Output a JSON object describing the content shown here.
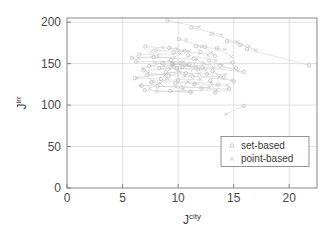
{
  "chart_data": {
    "type": "scatter",
    "title": "",
    "xlabel": "J",
    "xlabel_sup": "city",
    "ylabel": "J",
    "ylabel_sup": "irr",
    "xlim": [
      0,
      22.5
    ],
    "ylim": [
      0,
      205
    ],
    "xticks": [
      0,
      5,
      10,
      15,
      20
    ],
    "yticks": [
      0,
      50,
      100,
      150,
      200
    ],
    "xticklabels": [
      "0",
      "5",
      "10",
      "15",
      "20"
    ],
    "yticklabels": [
      "0",
      "50",
      "100",
      "150",
      "200"
    ],
    "grid": true,
    "grid_color": "#d2d2d2",
    "axis_color": "#7a7a7a",
    "legend": {
      "position": "lower-right",
      "entries": [
        {
          "label": "set-based",
          "marker": "circle",
          "color": "#b8b8b8"
        },
        {
          "label": "point-based",
          "marker": "cross",
          "color": "#b8b8b8"
        }
      ]
    },
    "series": [
      {
        "name": "set-based",
        "marker": "circle",
        "color": "#bcbcbc",
        "points": [
          [
            9.05,
            202.0
          ],
          [
            11.2,
            193.5
          ],
          [
            13.0,
            186.0
          ],
          [
            10.1,
            179.5
          ],
          [
            14.4,
            177.0
          ],
          [
            15.6,
            172.5
          ],
          [
            11.6,
            171.0
          ],
          [
            12.4,
            170.0
          ],
          [
            7.05,
            170.5
          ],
          [
            9.2,
            169.0
          ],
          [
            13.5,
            168.5
          ],
          [
            16.2,
            167.5
          ],
          [
            8.0,
            166.0
          ],
          [
            10.6,
            165.5
          ],
          [
            12.0,
            164.0
          ],
          [
            9.6,
            163.5
          ],
          [
            6.5,
            161.0
          ],
          [
            10.9,
            160.0
          ],
          [
            13.3,
            159.0
          ],
          [
            7.8,
            158.0
          ],
          [
            5.85,
            157.0
          ],
          [
            11.4,
            156.0
          ],
          [
            9.35,
            154.5
          ],
          [
            12.8,
            153.5
          ],
          [
            6.2,
            152.5
          ],
          [
            14.9,
            151.5
          ],
          [
            8.6,
            151.0
          ],
          [
            10.2,
            150.5
          ],
          [
            9.5,
            150.0
          ],
          [
            9.48,
            149.6
          ],
          [
            9.52,
            149.2
          ],
          [
            11.0,
            149.0
          ],
          [
            21.8,
            148.0
          ],
          [
            13.8,
            147.5
          ],
          [
            7.4,
            147.0
          ],
          [
            9.6,
            146.5
          ],
          [
            10.4,
            146.0
          ],
          [
            12.2,
            145.5
          ],
          [
            15.2,
            145.0
          ],
          [
            8.3,
            144.5
          ],
          [
            9.9,
            144.0
          ],
          [
            11.8,
            143.0
          ],
          [
            6.9,
            142.0
          ],
          [
            13.1,
            141.0
          ],
          [
            15.9,
            140.0
          ],
          [
            8.9,
            139.5
          ],
          [
            10.7,
            138.5
          ],
          [
            12.6,
            137.5
          ],
          [
            7.2,
            136.5
          ],
          [
            9.15,
            135.5
          ],
          [
            11.3,
            134.5
          ],
          [
            14.1,
            133.5
          ],
          [
            6.1,
            132.5
          ],
          [
            8.45,
            131.5
          ],
          [
            10.0,
            130.5
          ],
          [
            12.9,
            129.5
          ],
          [
            15.0,
            128.5
          ],
          [
            7.6,
            127.5
          ],
          [
            9.75,
            126.5
          ],
          [
            11.5,
            125.5
          ],
          [
            13.6,
            124.5
          ],
          [
            6.7,
            123.5
          ],
          [
            8.15,
            122.5
          ],
          [
            10.3,
            121.5
          ],
          [
            12.1,
            120.5
          ],
          [
            14.6,
            119.5
          ],
          [
            7.0,
            118.0
          ],
          [
            9.3,
            117.0
          ],
          [
            11.1,
            116.0
          ],
          [
            13.3,
            115.0
          ],
          [
            15.9,
            99.0
          ]
        ]
      },
      {
        "name": "point-based",
        "marker": "cross",
        "color": "#c4c4c4",
        "points": [
          [
            11.9,
            194.0
          ],
          [
            13.9,
            184.5
          ],
          [
            10.7,
            178.5
          ],
          [
            15.3,
            176.0
          ],
          [
            16.4,
            171.0
          ],
          [
            12.1,
            170.5
          ],
          [
            8.6,
            169.5
          ],
          [
            9.9,
            168.0
          ],
          [
            14.2,
            167.0
          ],
          [
            17.0,
            166.5
          ],
          [
            11.0,
            165.0
          ],
          [
            7.6,
            164.5
          ],
          [
            13.0,
            163.0
          ],
          [
            10.2,
            162.0
          ],
          [
            12.7,
            160.5
          ],
          [
            8.2,
            159.5
          ],
          [
            14.8,
            158.5
          ],
          [
            9.7,
            157.5
          ],
          [
            6.4,
            156.5
          ],
          [
            11.7,
            155.0
          ],
          [
            13.4,
            154.0
          ],
          [
            10.5,
            152.5
          ],
          [
            7.9,
            151.5
          ],
          [
            12.3,
            150.8
          ],
          [
            9.55,
            150.2
          ],
          [
            9.45,
            149.8
          ],
          [
            10.8,
            148.8
          ],
          [
            14.0,
            148.2
          ],
          [
            8.7,
            147.2
          ],
          [
            11.6,
            146.2
          ],
          [
            13.2,
            145.2
          ],
          [
            6.8,
            144.2
          ],
          [
            9.25,
            143.5
          ],
          [
            12.5,
            142.5
          ],
          [
            15.4,
            141.5
          ],
          [
            10.1,
            140.5
          ],
          [
            7.3,
            139.0
          ],
          [
            11.9,
            138.0
          ],
          [
            14.3,
            137.0
          ],
          [
            8.8,
            136.0
          ],
          [
            10.6,
            135.0
          ],
          [
            13.7,
            134.0
          ],
          [
            6.3,
            133.0
          ],
          [
            9.05,
            132.0
          ],
          [
            12.0,
            131.0
          ],
          [
            14.9,
            130.0
          ],
          [
            7.7,
            129.0
          ],
          [
            10.9,
            128.0
          ],
          [
            13.0,
            127.0
          ],
          [
            8.4,
            126.0
          ],
          [
            11.4,
            125.0
          ],
          [
            14.4,
            124.0
          ],
          [
            6.6,
            123.0
          ],
          [
            9.8,
            122.0
          ],
          [
            12.8,
            121.0
          ],
          [
            7.45,
            120.0
          ],
          [
            10.45,
            119.0
          ],
          [
            13.5,
            118.0
          ],
          [
            8.05,
            116.5
          ],
          [
            11.25,
            115.5
          ],
          [
            14.3,
            89.0
          ]
        ]
      }
    ],
    "connectors": [
      [
        [
          9.05,
          202.0
        ],
        [
          11.9,
          194.0
        ]
      ],
      [
        [
          11.2,
          193.5
        ],
        [
          13.9,
          184.5
        ]
      ],
      [
        [
          13.0,
          186.0
        ],
        [
          15.3,
          176.0
        ]
      ],
      [
        [
          10.1,
          179.5
        ],
        [
          12.1,
          170.5
        ]
      ],
      [
        [
          14.4,
          177.0
        ],
        [
          16.4,
          171.0
        ]
      ],
      [
        [
          7.05,
          170.5
        ],
        [
          9.9,
          168.0
        ]
      ],
      [
        [
          15.6,
          172.5
        ],
        [
          17.0,
          166.5
        ]
      ],
      [
        [
          11.6,
          171.0
        ],
        [
          14.2,
          167.0
        ]
      ],
      [
        [
          8.0,
          166.0
        ],
        [
          11.0,
          165.0
        ]
      ],
      [
        [
          9.2,
          169.0
        ],
        [
          12.7,
          160.5
        ]
      ],
      [
        [
          6.5,
          161.0
        ],
        [
          10.2,
          162.0
        ]
      ],
      [
        [
          13.5,
          168.5
        ],
        [
          14.8,
          158.5
        ]
      ],
      [
        [
          5.85,
          157.0
        ],
        [
          9.7,
          157.5
        ]
      ],
      [
        [
          7.8,
          158.0
        ],
        [
          11.7,
          155.0
        ]
      ],
      [
        [
          10.9,
          160.0
        ],
        [
          13.4,
          154.0
        ]
      ],
      [
        [
          6.2,
          152.5
        ],
        [
          10.5,
          152.5
        ]
      ],
      [
        [
          12.8,
          153.5
        ],
        [
          14.0,
          148.2
        ]
      ],
      [
        [
          8.6,
          151.0
        ],
        [
          12.3,
          150.8
        ]
      ],
      [
        [
          9.5,
          150.0
        ],
        [
          10.8,
          148.8
        ]
      ],
      [
        [
          11.4,
          156.0
        ],
        [
          13.2,
          145.2
        ]
      ],
      [
        [
          7.4,
          147.0
        ],
        [
          11.6,
          146.2
        ]
      ],
      [
        [
          6.9,
          142.0
        ],
        [
          9.25,
          143.5
        ]
      ],
      [
        [
          10.4,
          146.0
        ],
        [
          14.9,
          151.5
        ]
      ],
      [
        [
          8.3,
          144.5
        ],
        [
          12.5,
          142.5
        ]
      ],
      [
        [
          13.8,
          147.5
        ],
        [
          15.4,
          141.5
        ]
      ],
      [
        [
          9.9,
          144.0
        ],
        [
          15.2,
          145.0
        ]
      ],
      [
        [
          6.1,
          132.5
        ],
        [
          10.1,
          140.5
        ]
      ],
      [
        [
          12.2,
          145.5
        ],
        [
          15.9,
          140.0
        ]
      ],
      [
        [
          7.2,
          136.5
        ],
        [
          11.9,
          138.0
        ]
      ],
      [
        [
          8.9,
          139.5
        ],
        [
          14.3,
          137.0
        ]
      ],
      [
        [
          9.15,
          135.5
        ],
        [
          13.7,
          134.0
        ]
      ],
      [
        [
          10.0,
          130.5
        ],
        [
          12.0,
          131.0
        ]
      ],
      [
        [
          6.7,
          123.5
        ],
        [
          9.8,
          122.0
        ]
      ],
      [
        [
          8.15,
          122.5
        ],
        [
          12.8,
          121.0
        ]
      ],
      [
        [
          11.3,
          134.5
        ],
        [
          14.9,
          130.0
        ]
      ],
      [
        [
          7.6,
          127.5
        ],
        [
          10.9,
          128.0
        ]
      ],
      [
        [
          9.75,
          126.5
        ],
        [
          13.0,
          127.0
        ]
      ],
      [
        [
          11.5,
          125.5
        ],
        [
          14.4,
          124.0
        ]
      ],
      [
        [
          6.3,
          133.0
        ],
        [
          8.45,
          131.5
        ]
      ],
      [
        [
          7.0,
          118.0
        ],
        [
          11.25,
          115.5
        ]
      ],
      [
        [
          9.3,
          117.0
        ],
        [
          13.5,
          118.0
        ]
      ],
      [
        [
          10.3,
          121.5
        ],
        [
          14.6,
          119.5
        ]
      ],
      [
        [
          12.1,
          120.5
        ],
        [
          13.6,
          124.5
        ]
      ],
      [
        [
          8.05,
          116.5
        ],
        [
          11.1,
          116.0
        ]
      ],
      [
        [
          14.3,
          89.0
        ],
        [
          15.9,
          99.0
        ]
      ],
      [
        [
          13.1,
          141.0
        ],
        [
          14.1,
          133.5
        ]
      ],
      [
        [
          12.6,
          137.5
        ],
        [
          15.0,
          128.5
        ]
      ],
      [
        [
          7.9,
          151.5
        ],
        [
          9.6,
          146.5
        ]
      ],
      [
        [
          8.7,
          147.2
        ],
        [
          10.7,
          138.5
        ]
      ],
      [
        [
          9.45,
          149.8
        ],
        [
          11.0,
          149.0
        ]
      ],
      [
        [
          12.9,
          129.5
        ],
        [
          13.3,
          115.0
        ]
      ],
      [
        [
          7.3,
          139.0
        ],
        [
          8.8,
          136.0
        ]
      ],
      [
        [
          10.45,
          119.0
        ],
        [
          12.0,
          164.0
        ]
      ],
      [
        [
          9.6,
          163.5
        ],
        [
          10.6,
          165.5
        ]
      ],
      [
        [
          6.4,
          156.5
        ],
        [
          8.2,
          159.5
        ]
      ],
      [
        [
          7.45,
          120.0
        ],
        [
          9.05,
          132.0
        ]
      ],
      [
        [
          6.6,
          123.0
        ],
        [
          8.4,
          126.0
        ]
      ],
      [
        [
          6.8,
          144.2
        ],
        [
          9.35,
          154.5
        ]
      ],
      [
        [
          10.2,
          150.5
        ],
        [
          11.8,
          143.0
        ]
      ],
      [
        [
          12.4,
          170.0
        ],
        [
          13.3,
          159.0
        ]
      ],
      [
        [
          16.2,
          167.5
        ],
        [
          21.8,
          148.0
        ]
      ],
      [
        [
          7.7,
          129.0
        ],
        [
          10.0,
          130.5
        ]
      ],
      [
        [
          13.3,
          115.0
        ],
        [
          14.6,
          119.5
        ]
      ],
      [
        [
          9.52,
          149.2
        ],
        [
          12.2,
          145.5
        ]
      ],
      [
        [
          10.9,
          128.0
        ],
        [
          11.5,
          125.5
        ]
      ]
    ]
  }
}
